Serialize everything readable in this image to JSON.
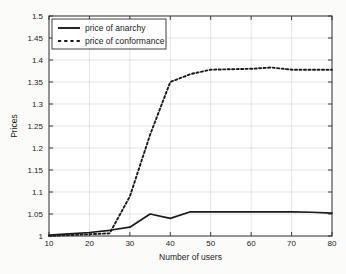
{
  "chart_data": {
    "type": "line",
    "title": "",
    "xlabel": "Number of users",
    "ylabel": "Prices",
    "xlim": [
      10,
      80
    ],
    "ylim": [
      1,
      1.5
    ],
    "grid": true,
    "legend_position": "top-left",
    "xticks": [
      "10",
      "20",
      "30",
      "40",
      "50",
      "60",
      "70",
      "80"
    ],
    "xtick_values": [
      10,
      20,
      30,
      40,
      50,
      60,
      70,
      80
    ],
    "yticks": [
      "1",
      "1.05",
      "1.1",
      "1.15",
      "1.2",
      "1.25",
      "1.3",
      "1.35",
      "1.4",
      "1.45",
      "1.5"
    ],
    "ytick_values": [
      1,
      1.05,
      1.1,
      1.15,
      1.2,
      1.25,
      1.3,
      1.35,
      1.4,
      1.45,
      1.5
    ],
    "x": [
      10,
      15,
      20,
      25,
      30,
      35,
      40,
      45,
      50,
      55,
      60,
      65,
      70,
      75,
      80
    ],
    "series": [
      {
        "name": "price of anarchy",
        "style": "solid",
        "color": "#1a1a1a",
        "values": [
          1.002,
          1.005,
          1.008,
          1.013,
          1.02,
          1.05,
          1.04,
          1.055,
          1.055,
          1.055,
          1.055,
          1.055,
          1.055,
          1.054,
          1.052
        ]
      },
      {
        "name": "price of conformance",
        "style": "dashed",
        "color": "#1a1a1a",
        "values": [
          1.0,
          1.002,
          1.004,
          1.006,
          1.09,
          1.23,
          1.35,
          1.368,
          1.378,
          1.379,
          1.38,
          1.383,
          1.378,
          1.378,
          1.378
        ]
      }
    ]
  },
  "legend": {
    "items": [
      {
        "label": "price of anarchy",
        "style": "solid"
      },
      {
        "label": "price of conformance",
        "style": "dashed"
      }
    ]
  }
}
